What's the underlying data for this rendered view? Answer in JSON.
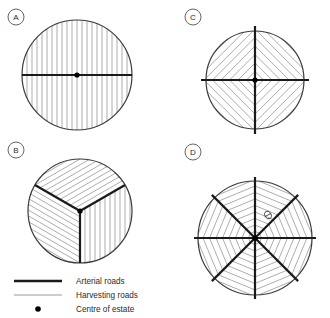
{
  "figure": {
    "title": "",
    "width": 330,
    "height": 318,
    "background": "#ffffff"
  },
  "styles": {
    "arterial_color": "#1a1a1a",
    "arterial_width": 2.2,
    "harvesting_color": "#8a8a8a",
    "harvesting_width": 0.7,
    "circle_outline_color": "#3a3a3a",
    "circle_outline_width": 1.2,
    "centre_dot_color": "#000000",
    "label_ring_color": "#555555",
    "text_color": "#2b2b2b"
  },
  "panels": [
    {
      "id": "A",
      "label": "A",
      "label_cx": 16,
      "label_cy": 17,
      "label_r": 8,
      "cx": 77,
      "cy": 75,
      "r": 55,
      "sectors": 1,
      "layout": "single-block-parallel",
      "description": "One arterial road across the diameter with parallel vertical harvesting roads",
      "arterial_angles_deg": [
        0,
        180
      ],
      "harvesting_orientation_deg": 90,
      "harvesting_spacing_px": 5
    },
    {
      "id": "B",
      "label": "B",
      "label_cx": 16,
      "label_cy": 150,
      "label_r": 8,
      "cx": 80,
      "cy": 211,
      "r": 52,
      "sectors": 3,
      "layout": "three-sector",
      "description": "Three 120-degree sectors, arterial roads radiating from centre, harvesting roads perpendicular within each sector",
      "arterial_angles_deg": [
        90,
        210,
        330
      ],
      "harvesting_spacing_px": 5
    },
    {
      "id": "C",
      "label": "C",
      "label_cx": 193,
      "label_cy": 17,
      "label_r": 8,
      "cx": 255,
      "cy": 80,
      "r": 49,
      "sectors": 4,
      "layout": "four-quadrant-herringbone",
      "description": "Cross of two arterial roads dividing circle into four quadrants with 45-degree herringbone harvesting roads",
      "arterial_angles_deg": [
        0,
        90,
        180,
        270
      ],
      "harvesting_spacing_px": 6
    },
    {
      "id": "D",
      "label": "D",
      "label_cx": 193,
      "label_cy": 152,
      "label_r": 8,
      "cx": 255,
      "cy": 238,
      "r": 57,
      "sectors": 8,
      "layout": "eight-sector-star",
      "description": "Eight sectors with arterial roads radiating from centre and chevron harvesting roads forming a star pattern",
      "arterial_angles_deg": [
        0,
        45,
        90,
        135,
        180,
        225,
        270,
        315
      ],
      "harvesting_spacing_px": 6,
      "annotation_marker": "theta",
      "annotation_x": 268,
      "annotation_y": 215
    }
  ],
  "legend": {
    "x": 14,
    "y": 281,
    "row_height": 14,
    "sample_width": 48,
    "items": [
      {
        "label": "Arterial roads",
        "symbol": "thick-line",
        "color": "#1a1a1a"
      },
      {
        "label": "Harvesting roads",
        "symbol": "thin-line",
        "color": "#9a9a9a"
      },
      {
        "label": "Centre of estate",
        "symbol": "dot",
        "color": "#000000"
      }
    ]
  }
}
